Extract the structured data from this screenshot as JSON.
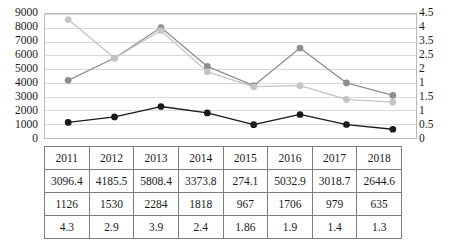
{
  "chart_data": {
    "type": "line",
    "title": "",
    "xlabel": "",
    "ylabel": "",
    "categories": [
      "2011",
      "2012",
      "2013",
      "2014",
      "2015",
      "2016",
      "2017",
      "2018"
    ],
    "grid": true,
    "legend_position": "none",
    "axes": {
      "left": {
        "ylim": [
          0,
          9000
        ],
        "ticks": [
          "9000",
          "8000",
          "7000",
          "6000",
          "5000",
          "4000",
          "3000",
          "2000",
          "1000",
          "0"
        ]
      },
      "right": {
        "ylim": [
          0,
          4.5
        ],
        "ticks": [
          "4.5",
          "4",
          "3.5",
          "2.5",
          "2",
          "1",
          "1.5",
          "1",
          "0.5",
          "0"
        ]
      }
    },
    "series": [
      {
        "name": "series-dark-gray",
        "axis": "left",
        "color": "#8f8f8f",
        "values": [
          4185.5,
          5808.4,
          8020,
          5190,
          3800,
          6530,
          4000,
          3100
        ]
      },
      {
        "name": "series-light-gray",
        "axis": "right",
        "color": "#c4c4c4",
        "values": [
          4.3,
          2.9,
          3.9,
          2.4,
          1.86,
          1.9,
          1.4,
          1.3
        ]
      },
      {
        "name": "series-black",
        "axis": "left",
        "color": "#1a1a1a",
        "values": [
          1126,
          1530,
          2284,
          1818,
          967,
          1706,
          979,
          635
        ]
      }
    ]
  },
  "table": {
    "rows": [
      [
        "2011",
        "2012",
        "2013",
        "2014",
        "2015",
        "2016",
        "2017",
        "2018"
      ],
      [
        "3096.4",
        "4185.5",
        "5808.4",
        "3373.8",
        "274.1",
        "5032.9",
        "3018.7",
        "2644.6"
      ],
      [
        "1126",
        "1530",
        "2284",
        "1818",
        "967",
        "1706",
        "979",
        "635"
      ],
      [
        "4.3",
        "2.9",
        "3.9",
        "2.4",
        "1.86",
        "1.9",
        "1.4",
        "1.3"
      ]
    ]
  }
}
